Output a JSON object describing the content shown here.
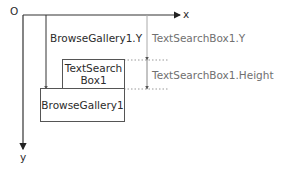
{
  "axes": {
    "origin_label": "O",
    "x_label": "x",
    "y_label": "y"
  },
  "boxes": {
    "browse_gallery": {
      "label": "BrowseGallery1"
    },
    "text_search_box": {
      "label_line1": "TextSearch",
      "label_line2": "Box1"
    }
  },
  "measurements": {
    "browse_gallery_y": "BrowseGallery1.Y",
    "text_search_box_y": "TextSearchBox1.Y",
    "text_search_box_height": "TextSearchBox1.Height"
  },
  "colors": {
    "axis": "#333333",
    "guide": "#999999",
    "box_border": "#555555"
  }
}
